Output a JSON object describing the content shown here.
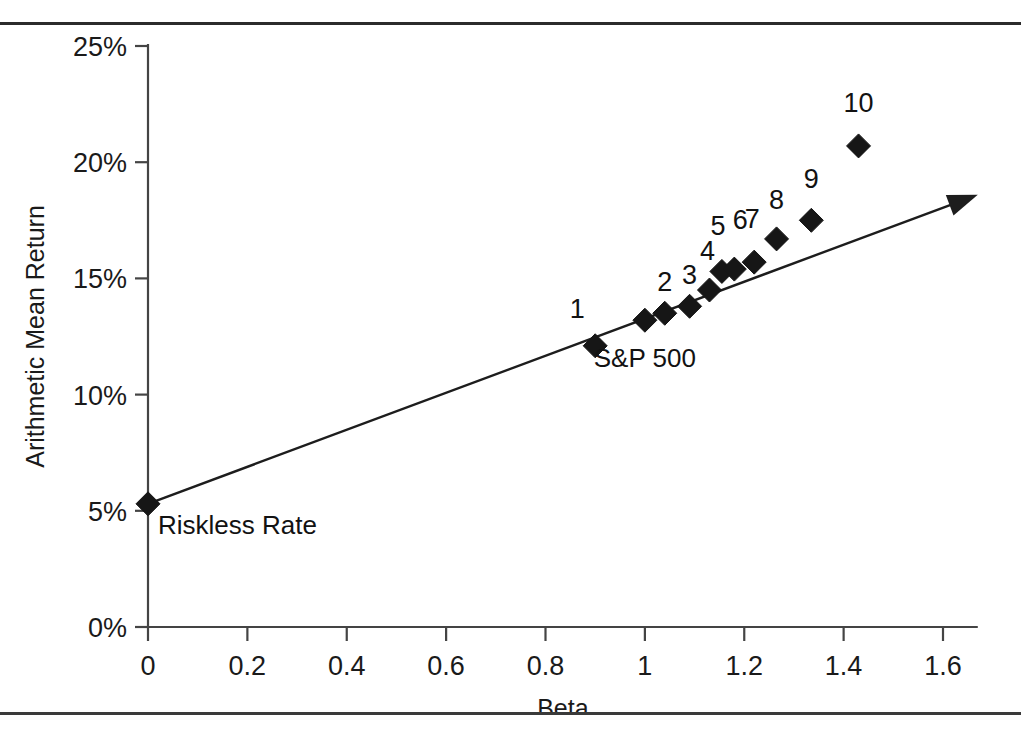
{
  "figure": {
    "title": "",
    "has_top_rule": true,
    "has_bottom_rule": true
  },
  "chart_data": {
    "type": "scatter",
    "title": "",
    "xlabel": "Beta",
    "ylabel": "Arithmetic Mean Return",
    "xlim": [
      0,
      1.67
    ],
    "ylim": [
      0,
      25
    ],
    "grid": false,
    "legend": "none",
    "x_ticks": [
      "0",
      "0.2",
      "0.4",
      "0.6",
      "0.8",
      "1",
      "1.2",
      "1.4",
      "1.6"
    ],
    "x_tick_values": [
      0,
      0.2,
      0.4,
      0.6,
      0.8,
      1.0,
      1.2,
      1.4,
      1.6
    ],
    "y_ticks": [
      "0%",
      "5%",
      "10%",
      "15%",
      "20%",
      "25%"
    ],
    "y_tick_values": [
      0,
      5,
      10,
      15,
      20,
      25
    ],
    "y_unit": "%",
    "points": [
      {
        "label": "Riskless Rate",
        "x": 0.0,
        "y": 5.3,
        "label_pos": "below-right"
      },
      {
        "label": "1",
        "x": 0.9,
        "y": 12.1,
        "label_pos": "above-left"
      },
      {
        "label": "S&P 500",
        "x": 1.0,
        "y": 13.2,
        "label_pos": "below"
      },
      {
        "label": "2",
        "x": 1.04,
        "y": 13.5,
        "label_pos": "above"
      },
      {
        "label": "3",
        "x": 1.09,
        "y": 13.8,
        "label_pos": "above"
      },
      {
        "label": "4",
        "x": 1.13,
        "y": 14.5,
        "label_pos": "above"
      },
      {
        "label": "5",
        "x": 1.155,
        "y": 15.3,
        "label_pos": "above"
      },
      {
        "label": "6",
        "x": 1.18,
        "y": 15.4,
        "label_pos": "above"
      },
      {
        "label": "7",
        "x": 1.22,
        "y": 15.7,
        "label_pos": "above"
      },
      {
        "label": "8",
        "x": 1.265,
        "y": 16.7,
        "label_pos": "above"
      },
      {
        "label": "9",
        "x": 1.335,
        "y": 17.5,
        "label_pos": "above"
      },
      {
        "label": "10",
        "x": 1.43,
        "y": 20.7,
        "label_pos": "above"
      }
    ],
    "line": {
      "name": "Security Market Line",
      "from": {
        "x": 0.0,
        "y": 5.3
      },
      "to": {
        "x": 1.67,
        "y": 18.6
      },
      "arrow_at_end": true
    },
    "annotations": [
      {
        "text": "Riskless Rate",
        "x": 0.02,
        "y": 4.0
      },
      {
        "text": "S&P 500",
        "x": 1.0,
        "y": 11.2
      }
    ],
    "colors": {
      "marker": "#161616",
      "line": "#1d1d1d",
      "axis": "#444444",
      "text": "#1a1a1a",
      "background": "#ffffff"
    }
  }
}
